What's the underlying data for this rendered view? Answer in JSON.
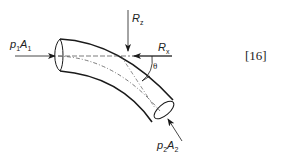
{
  "diagram": {
    "labels": {
      "inlet_force": {
        "var": "p",
        "sub1": "1",
        "var2": "A",
        "sub2": "1"
      },
      "outlet_force": {
        "var": "p",
        "sub1": "2",
        "var2": "A",
        "sub2": "2"
      },
      "reaction_z": {
        "var": "R",
        "sub": "z"
      },
      "reaction_x": {
        "var": "R",
        "sub": "x"
      },
      "angle": "θ"
    },
    "equation_number": "[16]",
    "colors": {
      "stroke": "#1a1a1a",
      "background": "#ffffff"
    }
  }
}
